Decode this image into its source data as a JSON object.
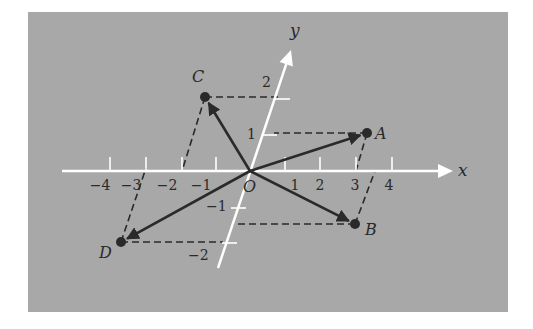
{
  "figure": {
    "panel": {
      "x": 28,
      "y": 12,
      "width": 480,
      "height": 300,
      "color": "#a8a8a8"
    },
    "colors": {
      "axis": "#ffffff",
      "ink": "#2a2a2a"
    },
    "origin": {
      "px": [
        250,
        171
      ],
      "label": "O",
      "label_pos": [
        243,
        192
      ]
    },
    "x_axis": {
      "label": "x",
      "start": [
        62,
        171
      ],
      "end": [
        453,
        171
      ],
      "label_pos": [
        458,
        176
      ],
      "ticks": [
        {
          "value": -4,
          "label": "−4",
          "x": 110,
          "label_x": 100
        },
        {
          "value": -3,
          "label": "−3",
          "x": 146,
          "label_x": 131
        },
        {
          "value": -2,
          "label": "−2",
          "x": 182,
          "label_x": 167
        },
        {
          "value": -1,
          "label": "−1",
          "x": 216,
          "label_x": 201
        },
        {
          "value": 1,
          "label": "1",
          "x": 285,
          "label_x": 295
        },
        {
          "value": 2,
          "label": "2",
          "x": 320,
          "label_x": 320
        },
        {
          "value": 3,
          "label": "3",
          "x": 356,
          "label_x": 355
        },
        {
          "value": 4,
          "label": "4",
          "x": 392,
          "label_x": 389
        }
      ],
      "tick_label_y": 190,
      "tick_top": 157
    },
    "y_axis": {
      "label": "y",
      "start": [
        218,
        268
      ],
      "end": [
        291,
        50
      ],
      "label_pos": [
        290,
        36
      ],
      "ticks": [
        {
          "value": 2,
          "label": "2",
          "x1": 275,
          "x2": 290,
          "y": 99,
          "label_pos": [
            262,
            87
          ]
        },
        {
          "value": 1,
          "label": "1",
          "x1": 263,
          "x2": 277,
          "y": 135,
          "label_pos": [
            247,
            139
          ]
        },
        {
          "value": -1,
          "label": "−1",
          "x1": 231,
          "x2": 246,
          "y": 208,
          "label_pos": [
            206,
            211
          ]
        },
        {
          "value": -2,
          "label": "−2",
          "x1": 222,
          "x2": 237,
          "y": 243,
          "label_pos": [
            188,
            260
          ]
        }
      ]
    },
    "points": [
      {
        "name": "A",
        "coords": [
          3,
          1
        ],
        "px": [
          367,
          133
        ],
        "label_pos": [
          375,
          139
        ],
        "y_axis_foot": [
          274,
          133
        ],
        "x_axis_foot": [
          356,
          171
        ]
      },
      {
        "name": "B",
        "coords": [
          3,
          -1
        ],
        "px": [
          355,
          224
        ],
        "label_pos": [
          365,
          235
        ],
        "y_axis_foot": [
          233,
          224
        ],
        "x_axis_foot": [
          375,
          171
        ]
      },
      {
        "name": "C",
        "coords": [
          -1,
          2
        ],
        "px": [
          205,
          97
        ],
        "label_pos": [
          192,
          82
        ],
        "y_axis_foot": [
          281,
          97
        ],
        "x_axis_foot": [
          182,
          171
        ]
      },
      {
        "name": "D",
        "coords": [
          -3,
          -2
        ],
        "px": [
          121,
          242
        ],
        "label_pos": [
          99,
          258
        ],
        "y_axis_foot": [
          223,
          242
        ],
        "x_axis_foot": [
          146,
          168
        ]
      }
    ],
    "vectors": [
      {
        "name": "OA",
        "from": "O",
        "to": "A"
      },
      {
        "name": "OB",
        "from": "O",
        "to": "B"
      },
      {
        "name": "OC",
        "from": "O",
        "to": "C"
      },
      {
        "name": "OD",
        "from": "O",
        "to": "D"
      }
    ]
  }
}
